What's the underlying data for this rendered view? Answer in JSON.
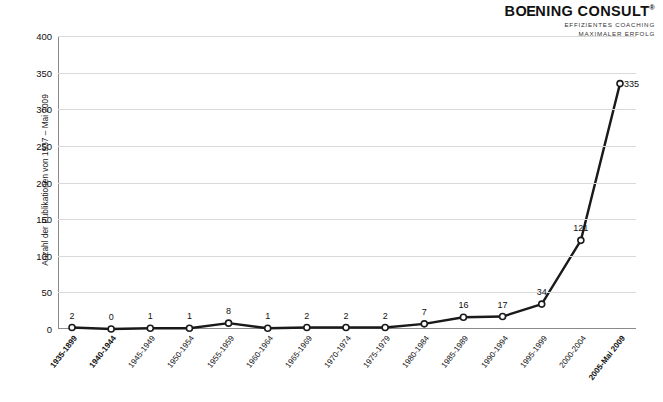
{
  "logo": {
    "brand_main": "B",
    "brand_oe": "OE",
    "brand_rest": "NING CONSULT",
    "trademark": "®",
    "tagline_line1": "EFFIZIENTES COACHING",
    "tagline_line2": "MAXIMALER ERFOLG"
  },
  "chart_data": {
    "type": "line",
    "title": "",
    "xlabel": "",
    "ylabel": "Anzahl der Publikationen von 1937 – Mai 2009",
    "categories": [
      "1935-1899",
      "1940-1944",
      "1945-1949",
      "1950-1954",
      "1955-1959",
      "1960-1964",
      "1965-1969",
      "1970-1974",
      "1975-1979",
      "1980-1984",
      "1985-1989",
      "1990-1994",
      "1995-1999",
      "2000-2004",
      "2005-Mai 2009"
    ],
    "values": [
      2,
      0,
      1,
      1,
      8,
      1,
      2,
      2,
      2,
      7,
      16,
      17,
      34,
      121,
      335
    ],
    "data_labels": [
      "2",
      "0",
      "1",
      "1",
      "8",
      "1",
      "2",
      "2",
      "2",
      "7",
      "16",
      "17",
      "34",
      "121",
      "335"
    ],
    "ylim": [
      0,
      400
    ],
    "yticks": [
      0,
      50,
      100,
      150,
      200,
      250,
      300,
      350,
      400
    ],
    "ytick_labels": [
      "0",
      "50",
      "100",
      "150",
      "200",
      "250",
      "300",
      "350",
      "400"
    ],
    "grid": "horizontal",
    "legend": "none",
    "series_color": "#1a1a1a",
    "marker": "circle-open"
  }
}
